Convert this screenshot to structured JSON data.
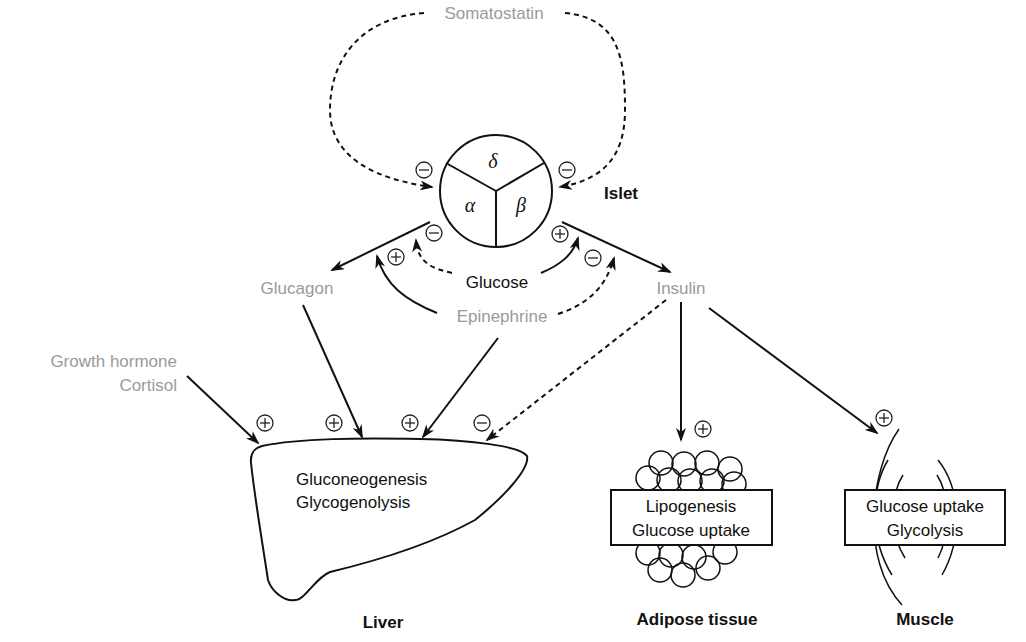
{
  "diagram": {
    "islet": {
      "label": "Islet",
      "cells": {
        "delta": "δ",
        "alpha": "α",
        "beta": "β"
      }
    },
    "hormones": {
      "somatostatin": "Somatostatin",
      "glucagon": "Glucagon",
      "insulin": "Insulin",
      "glucose": "Glucose",
      "epinephrine": "Epinephrine",
      "growth_hormone": "Growth hormone",
      "cortisol": "Cortisol"
    },
    "targets": {
      "liver": {
        "label": "Liver",
        "processes": [
          "Gluconeogenesis",
          "Glycogenolysis"
        ]
      },
      "adipose": {
        "label": "Adipose tissue",
        "processes": [
          "Lipogenesis",
          "Glucose uptake"
        ]
      },
      "muscle": {
        "label": "Muscle",
        "processes": [
          "Glucose uptake",
          "Glycolysis"
        ]
      }
    },
    "signs": {
      "plus": "+",
      "minus": "−"
    },
    "colors": {
      "line": "#111111",
      "hormone_text": "#9a9a9a",
      "label_text": "#111111"
    },
    "edges": [
      {
        "from": "Somatostatin",
        "to": "alpha",
        "effect": "−",
        "style": "dashed"
      },
      {
        "from": "Somatostatin",
        "to": "beta",
        "effect": "−",
        "style": "dashed"
      },
      {
        "from": "Glucose",
        "to": "alpha",
        "effect": "−",
        "style": "dashed"
      },
      {
        "from": "Glucose",
        "to": "beta",
        "effect": "+",
        "style": "solid"
      },
      {
        "from": "Epinephrine",
        "to": "alpha",
        "effect": "+",
        "style": "solid"
      },
      {
        "from": "Epinephrine",
        "to": "beta",
        "effect": "−",
        "style": "dashed"
      },
      {
        "from": "alpha",
        "to": "Glucagon",
        "style": "solid"
      },
      {
        "from": "beta",
        "to": "Insulin",
        "style": "solid"
      },
      {
        "from": "Growth hormone / Cortisol",
        "to": "Liver",
        "effect": "+",
        "style": "solid"
      },
      {
        "from": "Glucagon",
        "to": "Liver",
        "effect": "+",
        "style": "solid"
      },
      {
        "from": "Epinephrine",
        "to": "Liver",
        "effect": "+",
        "style": "solid"
      },
      {
        "from": "Insulin",
        "to": "Liver",
        "effect": "−",
        "style": "dashed"
      },
      {
        "from": "Insulin",
        "to": "Adipose tissue",
        "effect": "+",
        "style": "solid"
      },
      {
        "from": "Insulin",
        "to": "Muscle",
        "effect": "+",
        "style": "solid"
      }
    ]
  }
}
